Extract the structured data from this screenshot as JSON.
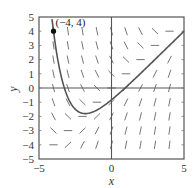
{
  "chart_data": {
    "type": "line",
    "title": "",
    "subtitle": "Direction field for dy/dx = x - y with solution curve through (-4, 4)",
    "xlabel": "x",
    "ylabel": "y",
    "xlim": [
      -5,
      5
    ],
    "ylim": [
      -5,
      5
    ],
    "grid": false,
    "legend": null,
    "x_ticks": [
      "-5",
      "0",
      "5"
    ],
    "y_ticks": [
      "5",
      "4",
      "3",
      "2",
      "1",
      "0",
      "-1",
      "-2",
      "-3",
      "-4",
      "-5"
    ],
    "direction_field": {
      "slope_function": "x - y",
      "x_positions": [
        -4,
        -3,
        -2,
        -1,
        0,
        1,
        2,
        3,
        4
      ],
      "y_positions": [
        -4,
        -3,
        -2,
        -1,
        0,
        1,
        2,
        3,
        4
      ]
    },
    "series": [
      {
        "name": "solution curve",
        "equation": "y = x - 1 + 9e^(-x-4)",
        "x": [
          -4.2,
          -4,
          -3.5,
          -3,
          -2.5,
          -2,
          -1.8,
          -1.5,
          -1,
          -0.5,
          0,
          1,
          2,
          3,
          4,
          5
        ],
        "y": [
          5.0,
          4.0,
          1.96,
          0.31,
          -1.45,
          -1.78,
          -1.8,
          -1.77,
          -1.56,
          -1.3,
          -0.84,
          0.0,
          1.02,
          2.0,
          3.0,
          4.0
        ]
      }
    ],
    "annotations": [
      {
        "text": "(−4, 4)",
        "x": -4,
        "y": 4,
        "marker": "filled-dot"
      }
    ]
  },
  "labels": {
    "x_axis": "x",
    "y_axis": "y",
    "point": "(−4, 4)",
    "xt_neg5": "−5",
    "xt_0": "0",
    "xt_5": "5",
    "yt": [
      "5",
      "4",
      "3",
      "2",
      "1",
      "0",
      "−1",
      "−2",
      "−3",
      "−4",
      "−5"
    ]
  },
  "colors": {
    "frame": "#555555",
    "curve": "#555555",
    "segments": "#666666",
    "point": "#111111"
  }
}
